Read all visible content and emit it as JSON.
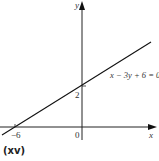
{
  "diagram": {
    "type": "coordinate-graph",
    "axes": {
      "x_label": "x",
      "y_label": "y",
      "origin_label": "0"
    },
    "line": {
      "equation": "x − 3y + 6 = 0",
      "x_intercept_label": "−6",
      "y_intercept_label": "2"
    },
    "caption": "(xv)",
    "colors": {
      "line": "#111111",
      "axis": "#222222",
      "background": "#ffffff"
    }
  }
}
